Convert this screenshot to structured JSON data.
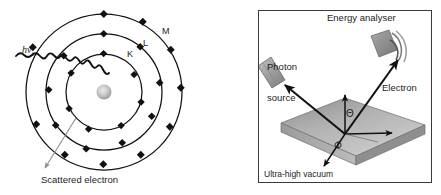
{
  "figure": {
    "kind": "xps-photoemission-schematic",
    "background_color": "#ffffff",
    "ink_color": "#1d1d1d"
  },
  "left_panel": {
    "name": "atom-photoionisation-diagram",
    "nucleus": {
      "label": "nucleus",
      "color_center": "#d8d8d8",
      "color_edge": "#9a9a9a"
    },
    "shells": [
      {
        "id": "K",
        "label": "K",
        "radius": 38,
        "electron_count": 7
      },
      {
        "id": "L",
        "label": "L",
        "radius": 58,
        "electron_count": 9
      },
      {
        "id": "M",
        "label": "M",
        "radius": 78,
        "electron_count": 10
      }
    ],
    "incoming_photon": {
      "label_html": "hν",
      "label_subscript": "in",
      "style": "wavy-line",
      "color": "#111111"
    },
    "scattered_electron": {
      "label": "Scattered electron",
      "arrow_color": "#8c8c8c",
      "arrow_style": "thin-line-with-arrowhead"
    },
    "electron_dot_color": "#111111",
    "orbit_line_color": "#111111"
  },
  "right_panel": {
    "name": "spectrometer-geometry-diagram",
    "border_color": "#3a3a3a",
    "caption": "Ultra-high vacuum",
    "components": [
      {
        "id": "photon-source",
        "label": "Photon\nsource",
        "label_line1": "Photon",
        "label_line2": "source",
        "color": "#9e9e9e"
      },
      {
        "id": "energy-analyser",
        "label": "Energy analyser",
        "color": "#8f8f8f"
      },
      {
        "id": "electron-path",
        "label": "Electron"
      }
    ],
    "angles": [
      {
        "id": "theta",
        "symbol": "Θ",
        "description": "polar emission angle from surface normal"
      },
      {
        "id": "phi",
        "symbol": "Φ",
        "description": "azimuthal angle in surface plane"
      }
    ],
    "sample": {
      "id": "sample-slab",
      "top_face_color_light": "#c9c9c9",
      "top_face_color_dark": "#8e8e8e",
      "side_face_color": "#9d9d9d",
      "front_face_color": "#b4b4b4"
    }
  }
}
